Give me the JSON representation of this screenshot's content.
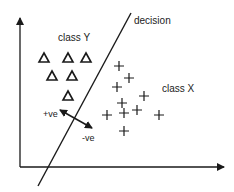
{
  "diagram": {
    "labels": {
      "decision": "decision",
      "class_y": "class Y",
      "class_x": "class X",
      "positive": "+ve",
      "negative": "-ve"
    },
    "colors": {
      "stroke": "#1a1a1a",
      "background": "#ffffff"
    },
    "axes": {
      "origin": [
        20,
        167
      ],
      "y_top": [
        20,
        18
      ],
      "x_right": [
        224,
        167
      ]
    },
    "decision_line": {
      "from": [
        38,
        186
      ],
      "to": [
        131,
        13
      ]
    },
    "class_y_points": [
      [
        44,
        58
      ],
      [
        68,
        58
      ],
      [
        86,
        58
      ],
      [
        52,
        76
      ],
      [
        72,
        76
      ],
      [
        68,
        96
      ]
    ],
    "class_x_points": [
      [
        119,
        66
      ],
      [
        129,
        78
      ],
      [
        117,
        87
      ],
      [
        144,
        96
      ],
      [
        122,
        103
      ],
      [
        137,
        110
      ],
      [
        107,
        115
      ],
      [
        124,
        113
      ],
      [
        159,
        115
      ],
      [
        124,
        131
      ]
    ],
    "margin_arrow": {
      "from": [
        60,
        110
      ],
      "to": [
        92,
        128
      ]
    }
  }
}
